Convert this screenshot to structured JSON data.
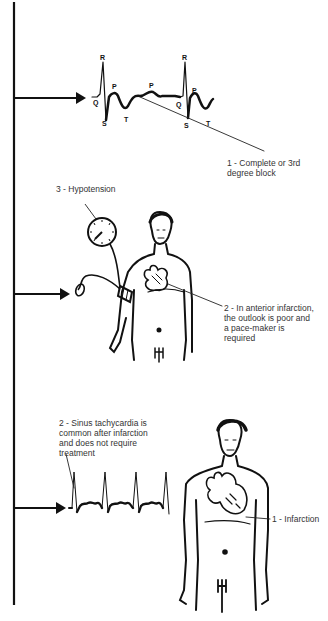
{
  "diagram": {
    "type": "medical-illustration",
    "colors": {
      "ink": "#111111",
      "label_text": "#333333",
      "background": "#ffffff"
    },
    "sections": [
      {
        "id": "heart-block",
        "ecg_letters": [
          "R",
          "Q",
          "P",
          "S",
          "T",
          "P",
          "R",
          "Q",
          "P",
          "S",
          "T"
        ],
        "annotation": {
          "line1": "1 - Complete or 3rd",
          "line2": "degree block"
        }
      },
      {
        "id": "anterior-infarction",
        "annotations": [
          {
            "text": "3 - Hypotension"
          },
          {
            "line1": "2 - In anterior infarction,",
            "line2": "the outlook is poor and",
            "line3": "a pace-maker is",
            "line4": "required"
          }
        ]
      },
      {
        "id": "sinus-tachycardia",
        "annotations": [
          {
            "line1": "2 - Sinus tachycardia is",
            "line2": "common after infarction",
            "line3": "and does not require",
            "line4": "treatment"
          },
          {
            "text": "1 - Infarction"
          }
        ]
      }
    ]
  }
}
